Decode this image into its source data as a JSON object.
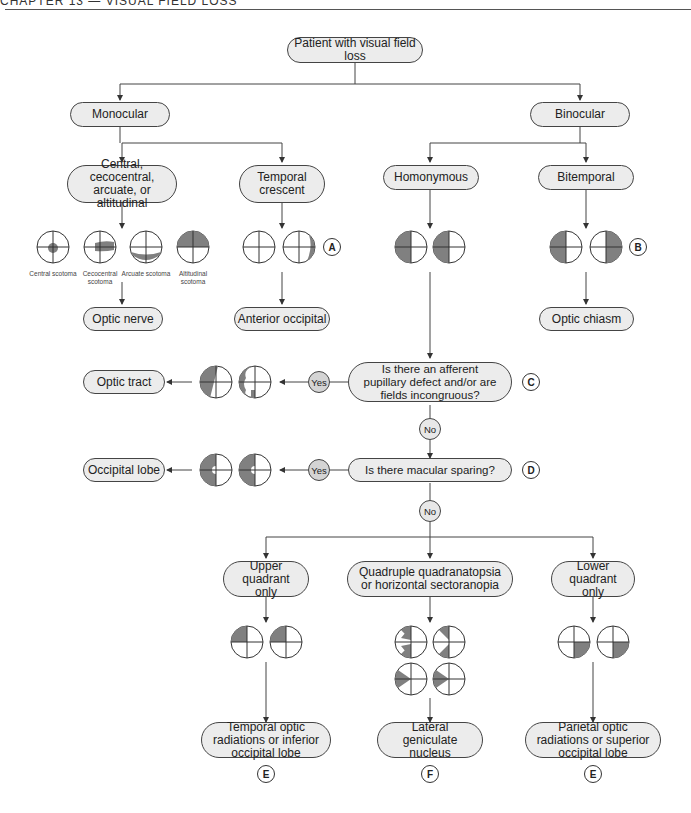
{
  "header": {
    "text": "CHAPTER 13 — VISUAL FIELD LOSS"
  },
  "colors": {
    "pill_fill": "#ececec",
    "defect_fill": "#808080",
    "line": "#444444",
    "yes_fill": "#d4d4d4"
  },
  "nodes": {
    "root": "Patient with visual field loss",
    "monocular": "Monocular",
    "binocular": "Binocular",
    "central": "Central, cecocentral, arcuate, or altitudinal",
    "temporal_crescent": "Temporal crescent",
    "homonymous": "Homonymous",
    "bitemporal": "Bitemporal",
    "optic_nerve": "Optic nerve",
    "anterior_occipital": "Anterior occipital",
    "optic_chiasm": "Optic chiasm",
    "q_apd": "Is there an afferent pupillary defect and/or are fields incongruous?",
    "optic_tract": "Optic tract",
    "q_macular": "Is there macular sparing?",
    "occipital_lobe": "Occipital lobe",
    "upper_quadrant": "Upper quadrant only",
    "quadruple": "Quadruple quadranatopsia or horizontal sectoranopia",
    "lower_quadrant": "Lower quadrant only",
    "temporal_radiations": "Temporal optic radiations or inferior occipital lobe",
    "lgn": "Lateral geniculate nucleus",
    "parietal_radiations": "Parietal optic radiations or superior occipital lobe"
  },
  "scotoma_labels": [
    "Central scotoma",
    "Cecocentral scotoma",
    "Arcuate scotoma",
    "Altitudinal scotoma"
  ],
  "answers": {
    "yes": "Yes",
    "no": "No"
  },
  "tags": {
    "a": "A",
    "b": "B",
    "c": "C",
    "d": "D",
    "e": "E",
    "f": "F"
  }
}
